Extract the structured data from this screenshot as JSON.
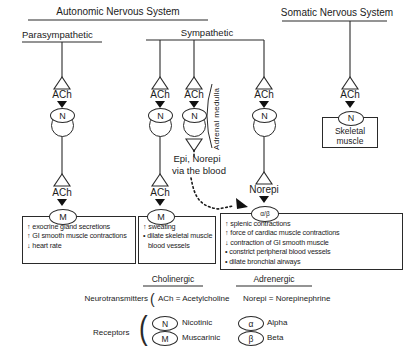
{
  "header": {
    "autonomic": "Autonomic Nervous System",
    "somatic": "Somatic Nervous System",
    "parasympathetic": "Parasympathetic",
    "sympathetic": "Sympathetic"
  },
  "labels": {
    "ach": "ACh",
    "norepi": "Norepi",
    "epi_norepi": "Epi, Norepi",
    "via_the_blood": "via the blood",
    "adrenal_medulla": "Adrenal medulla",
    "skeletal_muscle": "Skeletal muscle"
  },
  "receptor_symbols": {
    "nicotinic": "N",
    "muscarinic": "M",
    "adrenergic": "α/β",
    "alpha": "α",
    "beta": "β"
  },
  "effect_boxes": {
    "parasympathetic": {
      "lines": [
        "↑ exocrine gland secretions",
        "↑ GI smooth muscle contractions",
        "↓ heart rate"
      ]
    },
    "sympathetic_cholinergic": {
      "lines": [
        "↑ sweating",
        "• dilate skeletal muscle",
        "blood vessels"
      ]
    },
    "sympathetic_adrenergic": {
      "lines": [
        "↑ splenic contractions",
        "↑ force of cardiac muscle contractions",
        "↓ contraction of GI smooth muscle",
        "• constrict peripheral blood vessels",
        "• dilate bronchial airways"
      ]
    }
  },
  "legend": {
    "cholinergic_header": "Cholinergic",
    "adrenergic_header": "Adrenergic",
    "neurotransmitters_label": "Neurotransmitters",
    "neurotransmitters_bracket": "(",
    "ach_definition": "ACh = Acetylcholine",
    "norepi_definition": "Norepi = Norepinephrine",
    "receptors_label": "Receptors",
    "receptors_bracket": "(",
    "entries": [
      {
        "symbol": "N",
        "name": "Nicotinic"
      },
      {
        "symbol": "M",
        "name": "Muscarinic"
      },
      {
        "symbol": "α",
        "name": "Alpha"
      },
      {
        "symbol": "β",
        "name": "Beta"
      }
    ]
  }
}
